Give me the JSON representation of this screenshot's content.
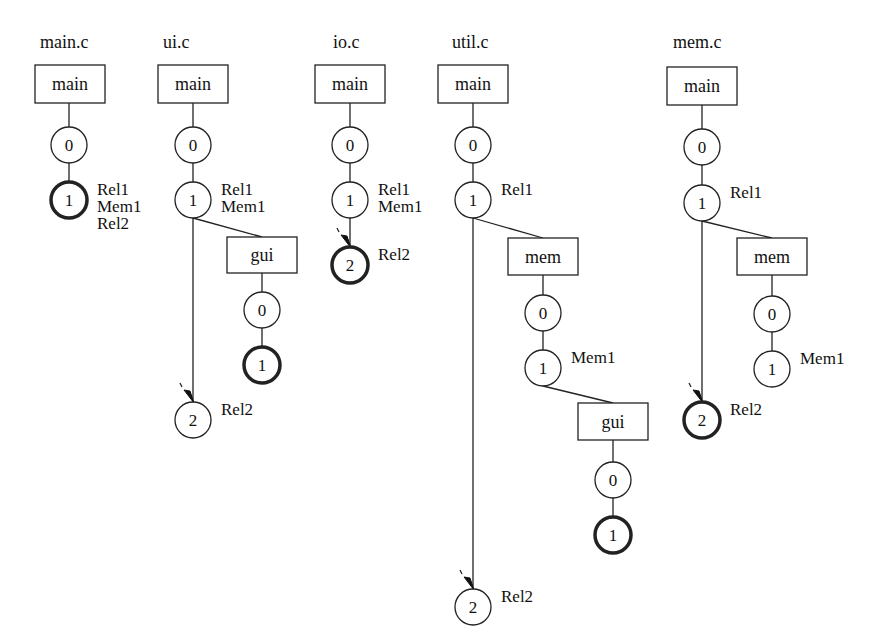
{
  "diagram": {
    "type": "version-trees",
    "files": [
      {
        "name": "main.c",
        "title_pos": [
          40,
          48
        ],
        "branches": [
          {
            "label": "main",
            "box": [
              35,
              65,
              70,
              38
            ]
          }
        ],
        "nodes": [
          {
            "id": "main.c/main/0",
            "label": "0",
            "cx": 69,
            "cy": 145,
            "bold": false,
            "tags": []
          },
          {
            "id": "main.c/main/1",
            "label": "1",
            "cx": 69,
            "cy": 200,
            "bold": true,
            "tags": [
              "Rel1",
              "Mem1",
              "Rel2"
            ]
          }
        ],
        "edges": [
          [
            69,
            103,
            69,
            127
          ],
          [
            69,
            163,
            69,
            182
          ]
        ],
        "arrows": []
      },
      {
        "name": "ui.c",
        "title_pos": [
          163,
          48
        ],
        "branches": [
          {
            "label": "main",
            "box": [
              158,
              65,
              70,
              38
            ]
          },
          {
            "label": "gui",
            "box": [
              227,
              237,
              70,
              36
            ]
          }
        ],
        "nodes": [
          {
            "id": "ui.c/main/0",
            "label": "0",
            "cx": 193,
            "cy": 145,
            "bold": false,
            "tags": []
          },
          {
            "id": "ui.c/main/1",
            "label": "1",
            "cx": 193,
            "cy": 200,
            "bold": false,
            "tags": [
              "Rel1",
              "Mem1"
            ]
          },
          {
            "id": "ui.c/gui/0",
            "label": "0",
            "cx": 262,
            "cy": 310,
            "bold": false,
            "tags": []
          },
          {
            "id": "ui.c/gui/1",
            "label": "1",
            "cx": 262,
            "cy": 365,
            "bold": true,
            "tags": []
          },
          {
            "id": "ui.c/main/2",
            "label": "2",
            "cx": 193,
            "cy": 420,
            "bold": false,
            "tags": [
              "Rel2"
            ]
          }
        ],
        "edges": [
          [
            193,
            103,
            193,
            127
          ],
          [
            193,
            163,
            193,
            182
          ],
          [
            193,
            218,
            262,
            237
          ],
          [
            262,
            273,
            262,
            292
          ],
          [
            262,
            328,
            262,
            347
          ],
          [
            193,
            218,
            193,
            402
          ]
        ],
        "arrows": [
          [
            193,
            402
          ]
        ]
      },
      {
        "name": "io.c",
        "title_pos": [
          333,
          48
        ],
        "branches": [
          {
            "label": "main",
            "box": [
              315,
              65,
              70,
              38
            ]
          }
        ],
        "nodes": [
          {
            "id": "io.c/main/0",
            "label": "0",
            "cx": 350,
            "cy": 145,
            "bold": false,
            "tags": []
          },
          {
            "id": "io.c/main/1",
            "label": "1",
            "cx": 350,
            "cy": 200,
            "bold": false,
            "tags": [
              "Rel1",
              "Mem1"
            ]
          },
          {
            "id": "io.c/main/2",
            "label": "2",
            "cx": 350,
            "cy": 265,
            "bold": true,
            "tags": [
              "Rel2"
            ]
          }
        ],
        "edges": [
          [
            350,
            103,
            350,
            127
          ],
          [
            350,
            163,
            350,
            182
          ],
          [
            350,
            218,
            350,
            247
          ]
        ],
        "arrows": [
          [
            350,
            247
          ]
        ]
      },
      {
        "name": "util.c",
        "title_pos": [
          452,
          48
        ],
        "branches": [
          {
            "label": "main",
            "box": [
              438,
              65,
              70,
              38
            ]
          },
          {
            "label": "mem",
            "box": [
              508,
              238,
              70,
              37
            ]
          },
          {
            "label": "gui",
            "box": [
              578,
              403,
              70,
              37
            ]
          }
        ],
        "nodes": [
          {
            "id": "util.c/main/0",
            "label": "0",
            "cx": 473,
            "cy": 145,
            "bold": false,
            "tags": []
          },
          {
            "id": "util.c/main/1",
            "label": "1",
            "cx": 473,
            "cy": 200,
            "bold": false,
            "tags": [
              "Rel1"
            ]
          },
          {
            "id": "util.c/mem/0",
            "label": "0",
            "cx": 543,
            "cy": 313,
            "bold": false,
            "tags": []
          },
          {
            "id": "util.c/mem/1",
            "label": "1",
            "cx": 543,
            "cy": 368,
            "bold": false,
            "tags": [
              "Mem1"
            ]
          },
          {
            "id": "util.c/gui/0",
            "label": "0",
            "cx": 613,
            "cy": 480,
            "bold": false,
            "tags": []
          },
          {
            "id": "util.c/gui/1",
            "label": "1",
            "cx": 613,
            "cy": 535,
            "bold": true,
            "tags": []
          },
          {
            "id": "util.c/main/2",
            "label": "2",
            "cx": 473,
            "cy": 607,
            "bold": false,
            "tags": [
              "Rel2"
            ]
          }
        ],
        "edges": [
          [
            473,
            103,
            473,
            127
          ],
          [
            473,
            163,
            473,
            182
          ],
          [
            473,
            218,
            543,
            238
          ],
          [
            543,
            275,
            543,
            295
          ],
          [
            543,
            331,
            543,
            350
          ],
          [
            543,
            386,
            613,
            403
          ],
          [
            613,
            440,
            613,
            462
          ],
          [
            613,
            498,
            613,
            517
          ],
          [
            473,
            218,
            473,
            589
          ]
        ],
        "arrows": [
          [
            473,
            589
          ]
        ]
      },
      {
        "name": "mem.c",
        "title_pos": [
          673,
          48
        ],
        "branches": [
          {
            "label": "main",
            "box": [
              667,
              67,
              70,
              38
            ]
          },
          {
            "label": "mem",
            "box": [
              737,
              238,
              70,
              37
            ]
          }
        ],
        "nodes": [
          {
            "id": "mem.c/main/0",
            "label": "0",
            "cx": 702,
            "cy": 147,
            "bold": false,
            "tags": []
          },
          {
            "id": "mem.c/main/1",
            "label": "1",
            "cx": 702,
            "cy": 203,
            "bold": false,
            "tags": [
              "Rel1"
            ]
          },
          {
            "id": "mem.c/mem/0",
            "label": "0",
            "cx": 772,
            "cy": 314,
            "bold": false,
            "tags": []
          },
          {
            "id": "mem.c/mem/1",
            "label": "1",
            "cx": 772,
            "cy": 369,
            "bold": false,
            "tags": [
              "Mem1"
            ]
          },
          {
            "id": "mem.c/main/2",
            "label": "2",
            "cx": 702,
            "cy": 420,
            "bold": true,
            "tags": [
              "Rel2"
            ]
          }
        ],
        "edges": [
          [
            702,
            105,
            702,
            129
          ],
          [
            702,
            165,
            702,
            185
          ],
          [
            702,
            221,
            772,
            238
          ],
          [
            772,
            275,
            772,
            296
          ],
          [
            772,
            332,
            772,
            351
          ],
          [
            702,
            221,
            702,
            402
          ]
        ],
        "arrows": [
          [
            702,
            402
          ]
        ]
      }
    ]
  }
}
